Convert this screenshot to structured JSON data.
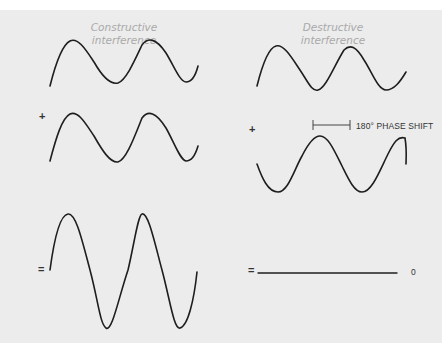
{
  "diagram": {
    "columns": [
      {
        "title_line1": "Constructive",
        "title_line2": "interference",
        "plus_symbol": "+",
        "equals_symbol": "=",
        "waves": [
          "wave 1 (in phase)",
          "wave 2 (in phase)",
          "resultant (double amplitude)"
        ]
      },
      {
        "title_line1": "Destructive",
        "title_line2": "interference",
        "plus_symbol": "+",
        "equals_symbol": "=",
        "phase_shift_label": "180° PHASE SHIFT",
        "result_label": "0",
        "waves": [
          "wave 1",
          "wave 2 (180° out of phase)",
          "resultant (flat, zero amplitude)"
        ]
      }
    ],
    "colors": {
      "background": "#ececec",
      "wave_stroke": "#1e1e1e",
      "title_text": "#a9a9a9"
    }
  }
}
